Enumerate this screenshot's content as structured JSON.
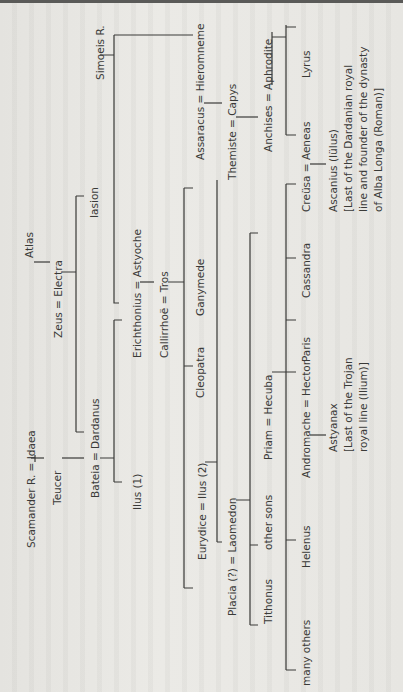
{
  "document": {
    "type": "genealogical-tree",
    "subject": "Royal house of Troy / Dardanian line",
    "orientation": "rotated 90 degrees counter-clockwise",
    "colors": {
      "ink": "#3a3a38",
      "paper": "#e6e5e1"
    }
  },
  "people": {
    "simoeis": "Simoeis R.",
    "atlas": "Atlas",
    "zeus_electra": "Zeus = Electra",
    "iasion": "Iasion",
    "scamander_idaea": "Scamander R. = Idaea",
    "teucer": "Teucer",
    "bateia_dardanus": "Bateia = Dardanus",
    "ilus1": "Ilus (1)",
    "erichthonius_astyoche": "Erichthonius = Astyoche",
    "callirrhoe_tros": "Callirrhoë = Tros",
    "cleopatra": "Cleopatra",
    "ganymede": "Ganymede",
    "assaracus_hieromneme": "Assaracus = Hieromneme",
    "eurydice_ilus2": "Eurydice = Ilus (2)",
    "themiste_capys": "Themiste = Capys",
    "anchises_aphrodite": "Anchises = Aphrodite",
    "placia_laomedon": "Placia (?) = Laomedon",
    "tithonus": "Tithonus",
    "other_sons": "other sons",
    "priam_hecuba": "Priam = Hecuba",
    "creusa_aeneas": "Creüsa = Aeneas",
    "lyrus": "Lyrus",
    "cassandra": "Cassandra",
    "paris": "Paris",
    "andromache_hector": "Andromache = Hector",
    "helenus": "Helenus",
    "many_others": "many others",
    "ascanius": {
      "line1": "Ascanius (Iülus)",
      "line2": "[Last of the Dardanian royal",
      "line3": "line and founder of the dynasty",
      "line4": "of Alba Longa (Roman)]"
    },
    "astyanax": {
      "line1": "Astyanax",
      "line2": "[Last of the Trojan",
      "line3": "royal line (Ilium)]"
    }
  }
}
